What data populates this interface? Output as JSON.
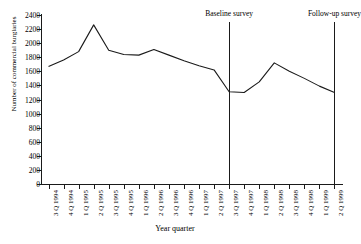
{
  "chart_data": {
    "type": "line",
    "title": "",
    "xlabel": "Year quarter",
    "ylabel": "Number of commercial burglaries",
    "ylim": [
      0,
      2400
    ],
    "ytick_step": 200,
    "grid": false,
    "legend": null,
    "categories": [
      "3 Q 1994",
      "4 Q 1994",
      "1 Q 1995",
      "2 Q 1995",
      "3 Q 1995",
      "4 Q 1995",
      "1 Q 1996",
      "2 Q 1996",
      "3 Q 1996",
      "4 Q 1996",
      "1 Q 1997",
      "2 Q 1997",
      "3 Q 1997",
      "4 Q 1997",
      "1 Q 1998",
      "2 Q 1998",
      "3 Q 1998",
      "4 Q 1998",
      "1 Q 1999",
      "2 Q 1999"
    ],
    "yticks": [
      0,
      200,
      400,
      600,
      800,
      1000,
      1200,
      1400,
      1600,
      1800,
      2000,
      2200,
      2400
    ],
    "series": [
      {
        "name": "Commercial burglaries",
        "values": [
          1670,
          1760,
          1880,
          2260,
          1900,
          1840,
          1830,
          1910,
          1830,
          1750,
          1680,
          1620,
          1310,
          1300,
          1450,
          1720,
          1600,
          1500,
          1390,
          1300
        ]
      }
    ],
    "annotations": [
      {
        "label": "Baseline survey",
        "at_category": "3 Q 1997"
      },
      {
        "label": "Follow-up survey",
        "at_category": "2 Q 1999"
      }
    ]
  }
}
